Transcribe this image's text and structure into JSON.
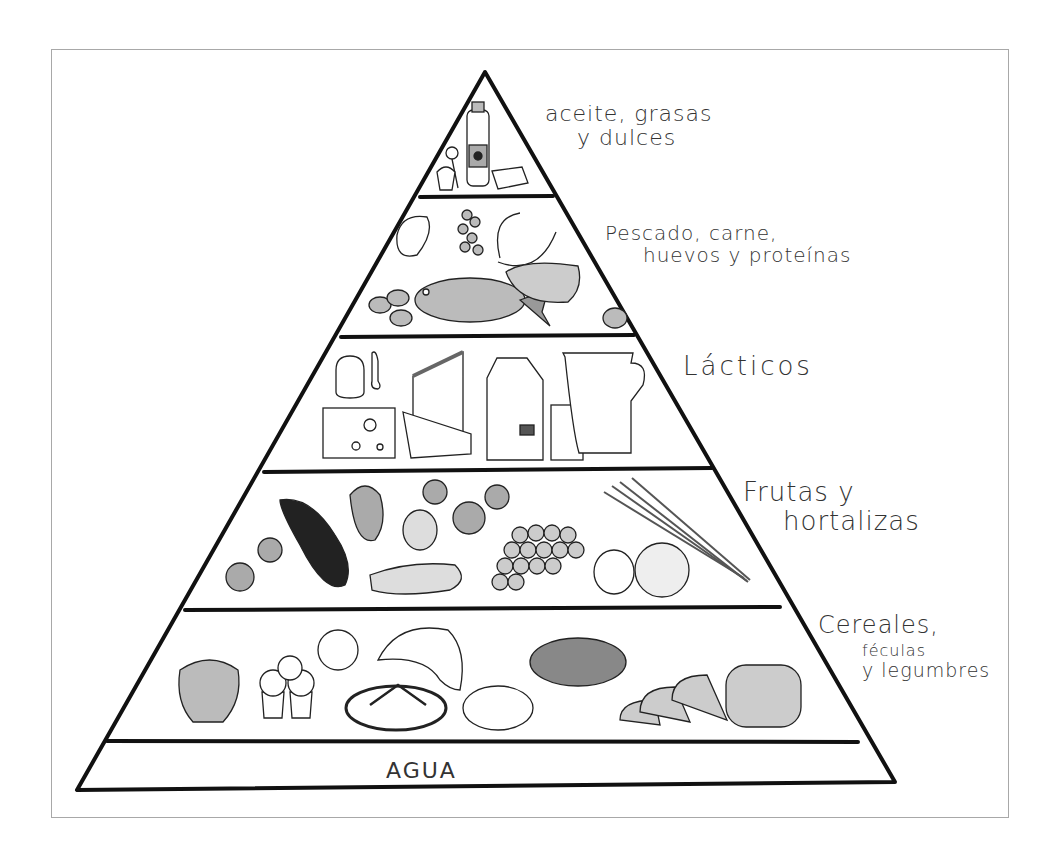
{
  "diagram": {
    "type": "food-pyramid",
    "language": "es",
    "tiers": [
      {
        "level": 1,
        "label_lines": [
          "aceite, grasas",
          "y dulces"
        ],
        "items": [
          "bottle-of-oil",
          "lollipop",
          "cupcake",
          "butter-stick"
        ]
      },
      {
        "level": 2,
        "label_lines": [
          "Pescado, carne,",
          "huevos y proteínas"
        ],
        "items": [
          "steak",
          "beans",
          "sausages",
          "fish",
          "meat-fillet",
          "eggs"
        ]
      },
      {
        "level": 3,
        "label_lines": [
          "Lácticos"
        ],
        "items": [
          "yogurt-jar",
          "spoon",
          "cheese-wedge",
          "swiss-cheese",
          "cheese-slice",
          "milk-carton",
          "glass",
          "jug"
        ]
      },
      {
        "level": 4,
        "label_lines": [
          "Frutas y",
          "hortalizas"
        ],
        "items": [
          "broccoli",
          "eggplant",
          "bell-pepper",
          "orange",
          "peach",
          "cucumber",
          "grapes",
          "lemon",
          "grapefruit",
          "carrots"
        ]
      },
      {
        "level": 5,
        "label_lines": [
          "Cereales,",
          "féculas",
          "y legumbres"
        ],
        "items": [
          "noodle-bowl",
          "muffins",
          "cereal",
          "croissant",
          "bread-loaf",
          "potato",
          "lentil-bowl",
          "sliced-bread"
        ]
      },
      {
        "level": 6,
        "label_lines": [
          "AGUA"
        ],
        "items": []
      }
    ],
    "colors": {
      "line": "#111111",
      "frame": "#a8a8a8",
      "fill_gray": "#b8b8b8",
      "fill_dark": "#222222",
      "text": "#333333",
      "background": "#ffffff"
    }
  }
}
